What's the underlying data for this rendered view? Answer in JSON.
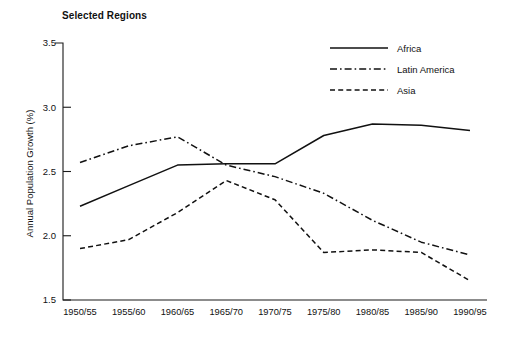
{
  "chart_data": {
    "type": "line",
    "title": "Selected Regions",
    "xlabel": "",
    "ylabel": "Annual Population Growth (%)",
    "categories": [
      "1950/55",
      "1955/60",
      "1960/65",
      "1965/70",
      "1970/75",
      "1975/80",
      "1980/85",
      "1985/90",
      "1990/95"
    ],
    "ylim": [
      1.5,
      3.5
    ],
    "yticks": [
      "1.5",
      "2.0",
      "2.5",
      "3.0",
      "3.5"
    ],
    "ytick_values": [
      1.5,
      2.0,
      2.5,
      3.0,
      3.5
    ],
    "grid": false,
    "legend_position": "top-right",
    "series": [
      {
        "name": "Africa",
        "style": "solid",
        "color": "#111111",
        "values": [
          2.23,
          2.39,
          2.55,
          2.56,
          2.56,
          2.78,
          2.87,
          2.86,
          2.82
        ]
      },
      {
        "name": "Latin America",
        "style": "dash-dot",
        "color": "#111111",
        "values": [
          2.57,
          2.7,
          2.77,
          2.55,
          2.46,
          2.33,
          2.12,
          1.95,
          1.85
        ]
      },
      {
        "name": "Asia",
        "style": "dashed",
        "color": "#111111",
        "values": [
          1.9,
          1.97,
          2.18,
          2.43,
          2.28,
          1.87,
          1.89,
          1.87,
          1.65
        ]
      }
    ]
  }
}
